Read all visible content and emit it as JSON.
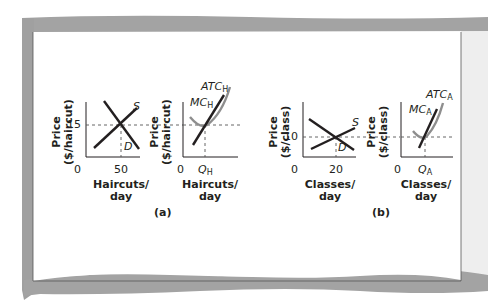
{
  "figure": {
    "panel_a_label": "(a)",
    "panel_b_label": "(b)"
  },
  "charts": [
    {
      "id": "haircut-market",
      "y_axis_title_line1": "Price",
      "y_axis_title_line2": "($/haircut)",
      "y_tick": "15",
      "origin": "0",
      "x_tick": "50",
      "x_axis_title_line1": "Haircuts/",
      "x_axis_title_line2": "day",
      "supply_label": "S",
      "demand_label": "D"
    },
    {
      "id": "haircut-firm",
      "y_axis_title_line1": "Price",
      "y_axis_title_line2": "($/haircut)",
      "origin": "0",
      "x_tick_main": "Q",
      "x_tick_sub": "H",
      "x_axis_title_line1": "Haircuts/",
      "x_axis_title_line2": "day",
      "atc_main": "ATC",
      "atc_sub": "H",
      "mc_main": "MC",
      "mc_sub": "H"
    },
    {
      "id": "class-market",
      "y_axis_title_line1": "Price",
      "y_axis_title_line2": "($/class)",
      "y_tick": "10",
      "origin": "0",
      "x_tick": "20",
      "x_axis_title_line1": "Classes/",
      "x_axis_title_line2": "day",
      "supply_label": "S",
      "demand_label": "D"
    },
    {
      "id": "class-firm",
      "y_axis_title_line1": "Price",
      "y_axis_title_line2": "($/class)",
      "origin": "0",
      "x_tick_main": "Q",
      "x_tick_sub": "A",
      "x_axis_title_line1": "Classes/",
      "x_axis_title_line2": "day",
      "atc_main": "ATC",
      "atc_sub": "A",
      "mc_main": "MC",
      "mc_sub": "A"
    }
  ],
  "colors": {
    "curve_dark": "#231f20",
    "curve_gray": "#8e8e8e",
    "frame_gray": "#9a9a9a",
    "right_panel": "#ededed"
  }
}
